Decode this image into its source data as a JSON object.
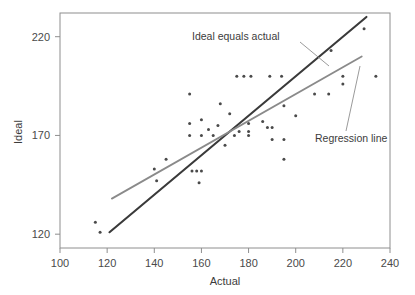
{
  "chart_data": {
    "type": "scatter",
    "title": "",
    "xlabel": "Actual",
    "ylabel": "Ideal",
    "xlim": [
      100,
      240
    ],
    "ylim": [
      113,
      232
    ],
    "xticks": [
      100,
      120,
      140,
      160,
      180,
      200,
      220,
      240
    ],
    "yticks": [
      120,
      170,
      220
    ],
    "xtick_labels": [
      "100",
      "120",
      "140",
      "160",
      "180",
      "200",
      "220",
      "240"
    ],
    "ytick_labels": [
      "120",
      "170",
      "220"
    ],
    "grid": false,
    "legend_position": "none",
    "point_color": "#4a4a4a",
    "points": [
      {
        "x": 115,
        "y": 126
      },
      {
        "x": 117,
        "y": 121
      },
      {
        "x": 140,
        "y": 153
      },
      {
        "x": 141,
        "y": 147
      },
      {
        "x": 145,
        "y": 158
      },
      {
        "x": 155,
        "y": 170
      },
      {
        "x": 155,
        "y": 176
      },
      {
        "x": 155,
        "y": 191
      },
      {
        "x": 156,
        "y": 152
      },
      {
        "x": 158,
        "y": 152
      },
      {
        "x": 159,
        "y": 146
      },
      {
        "x": 160,
        "y": 152
      },
      {
        "x": 160,
        "y": 170
      },
      {
        "x": 160,
        "y": 178
      },
      {
        "x": 163,
        "y": 173
      },
      {
        "x": 165,
        "y": 170
      },
      {
        "x": 167,
        "y": 175
      },
      {
        "x": 168,
        "y": 186
      },
      {
        "x": 170,
        "y": 165
      },
      {
        "x": 172,
        "y": 181
      },
      {
        "x": 174,
        "y": 170
      },
      {
        "x": 175,
        "y": 200
      },
      {
        "x": 176,
        "y": 172
      },
      {
        "x": 178,
        "y": 200
      },
      {
        "x": 180,
        "y": 176
      },
      {
        "x": 180,
        "y": 172
      },
      {
        "x": 180,
        "y": 170
      },
      {
        "x": 181,
        "y": 200
      },
      {
        "x": 186,
        "y": 177
      },
      {
        "x": 188,
        "y": 174
      },
      {
        "x": 189,
        "y": 200
      },
      {
        "x": 190,
        "y": 168
      },
      {
        "x": 190,
        "y": 174
      },
      {
        "x": 194,
        "y": 200
      },
      {
        "x": 195,
        "y": 158
      },
      {
        "x": 195,
        "y": 168
      },
      {
        "x": 195,
        "y": 185
      },
      {
        "x": 200,
        "y": 180
      },
      {
        "x": 208,
        "y": 191
      },
      {
        "x": 214,
        "y": 191
      },
      {
        "x": 215,
        "y": 213
      },
      {
        "x": 220,
        "y": 196
      },
      {
        "x": 220,
        "y": 200
      },
      {
        "x": 229,
        "y": 224
      },
      {
        "x": 234,
        "y": 200
      }
    ],
    "lines": [
      {
        "name": "Ideal equals actual",
        "color": "#3a3a3a",
        "width": 2.1,
        "x_start": 121,
        "y_start": 121,
        "x_end": 230,
        "y_end": 230
      },
      {
        "name": "Regression line",
        "color": "#8a8a8a",
        "width": 1.8,
        "x_start": 122,
        "y_start": 138,
        "x_end": 228,
        "y_end": 210
      }
    ],
    "annotations": [
      {
        "text": "Ideal equals actual",
        "label_x": 192,
        "label_y": 40,
        "leader_from_x": 300,
        "leader_from_y": 42,
        "leader_to_x": 329,
        "leader_to_y": 66
      },
      {
        "text": "Regression line",
        "label_x": 315,
        "label_y": 142,
        "leader_from_x": 346,
        "leader_from_y": 131,
        "leader_to_x": 360,
        "leader_to_y": 66
      }
    ]
  }
}
